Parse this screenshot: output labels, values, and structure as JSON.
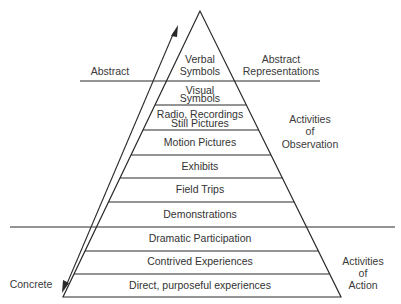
{
  "diagram": {
    "levels": [
      {
        "lines": [
          "Verbal",
          "Symbols"
        ]
      },
      {
        "lines": [
          "Visual",
          "Symbols"
        ]
      },
      {
        "lines": [
          "Radio, Recordings",
          "Still Pictures"
        ]
      },
      {
        "lines": [
          "Motion Pictures"
        ]
      },
      {
        "lines": [
          "Exhibits"
        ]
      },
      {
        "lines": [
          "Field Trips"
        ]
      },
      {
        "lines": [
          "Demonstrations"
        ]
      },
      {
        "lines": [
          "Dramatic Participation"
        ]
      },
      {
        "lines": [
          "Contrived Experiences"
        ]
      },
      {
        "lines": [
          "Direct, purposeful experiences"
        ]
      }
    ],
    "axis": {
      "top_label": "Abstract",
      "bottom_label": "Concrete"
    },
    "groups": {
      "abstract": [
        "Abstract",
        "Representations"
      ],
      "observation": [
        "Activities",
        "of",
        "Observation"
      ],
      "action": [
        "Activities",
        "of",
        "Action"
      ]
    },
    "colors": {
      "line": "#2a2a2a",
      "text": "#333333",
      "background": "#ffffff"
    }
  }
}
